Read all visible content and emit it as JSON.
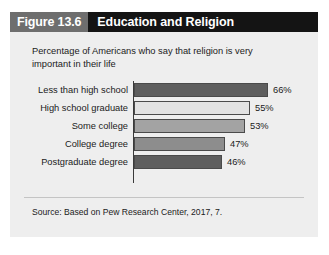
{
  "figure": {
    "number_label": "Figure 13.6",
    "title": "Education and Religion",
    "subtitle": "Percentage of Americans who say that religion is very important in their life",
    "source": "Source: Based on Pew Research Center, 2017, 7.",
    "header_number_bg": "#6e6e6e",
    "header_title_bg": "#141414",
    "panel_bg": "#eeeeee"
  },
  "chart_data": {
    "type": "bar",
    "orientation": "horizontal",
    "title": "Education and Religion",
    "subtitle": "Percentage of Americans who say that religion is very important in their life",
    "xlabel": "",
    "ylabel": "",
    "xlim": [
      0,
      70
    ],
    "grid": false,
    "legend": "none",
    "categories": [
      "Less than high school",
      "High school graduate",
      "Some college",
      "College degree",
      "Postgraduate degree"
    ],
    "values": [
      66,
      55,
      53,
      47,
      46
    ],
    "value_labels": [
      "66%",
      "55%",
      "53%",
      "47%",
      "46%"
    ],
    "bar_colors": [
      "#5e5e5e",
      "#e2e2e2",
      "#a3a3a3",
      "#8d8d8d",
      "#5e5e5e"
    ],
    "bar_border_color": "#4a4a4a",
    "bar_pixel_widths": [
      134,
      116,
      111,
      91,
      88
    ],
    "source": "Source: Based on Pew Research Center, 2017, 7."
  }
}
